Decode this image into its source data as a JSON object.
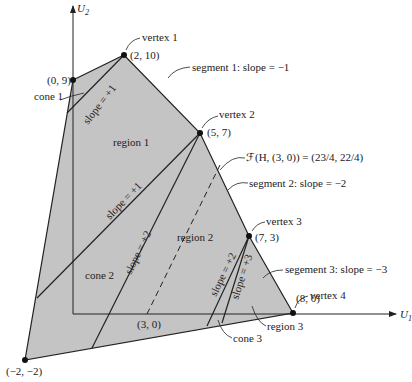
{
  "diagram": {
    "colors": {
      "fill": "#c4c4c4",
      "stroke": "#222222",
      "background": "#ffffff"
    },
    "axes": {
      "x_label": "U",
      "x_sub": "1",
      "y_label": "U",
      "y_sub": "2"
    },
    "points": [
      {
        "id": "p09",
        "label": "(0, 9)"
      },
      {
        "id": "v1",
        "label": "(2, 10)"
      },
      {
        "id": "v2",
        "label": "(5, 7)"
      },
      {
        "id": "v3",
        "label": "(7, 3)"
      },
      {
        "id": "v4",
        "label": "(8, 0)"
      },
      {
        "id": "pm2",
        "label": "(−2, −2)"
      },
      {
        "id": "p30",
        "label": "(3, 0)"
      }
    ],
    "vertex_labels": {
      "v1": "vertex 1",
      "v2": "vertex 2",
      "v3": "vertex 3",
      "v4": "vertex 4"
    },
    "segment_labels": {
      "s1": "segment 1:  slope = −1",
      "s2": "segment 2:  slope = −2",
      "s3": "segement 3:  slope = −3"
    },
    "fh_label": "ℱ(H, (3, 0)) = (23/4, 22/4)",
    "region_labels": {
      "region1": "region 1",
      "region2": "region 2",
      "region3": "region 3"
    },
    "cone_labels": {
      "cone1": "cone 1",
      "cone2": "cone 2",
      "cone3": "cone 3"
    },
    "slope_labels": {
      "cone1_slope": "slope = +1",
      "v2_slope1": "slope = +1",
      "v2_slope2": "slope = +2",
      "v3_slope2": "slope = +2",
      "v3_slope3": "slope = +3"
    }
  }
}
